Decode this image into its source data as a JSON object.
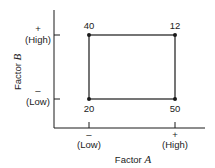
{
  "x_axis": {
    "title": "Factor",
    "title_var": "A",
    "low_sign": "–",
    "low_label": "(Low)",
    "high_sign": "+",
    "high_label": "(High)"
  },
  "y_axis": {
    "title": "Factor",
    "title_var": "B",
    "low_sign": "–",
    "low_label": "(Low)",
    "high_sign": "+",
    "high_label": "(High)"
  },
  "corners": {
    "low_low": "20",
    "high_low": "50",
    "low_high": "40",
    "high_high": "12"
  },
  "colors": {
    "line": "#1a1a1a"
  }
}
